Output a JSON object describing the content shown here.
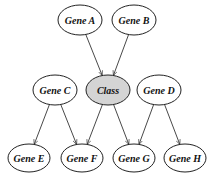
{
  "diagram": {
    "type": "bayesian-network",
    "colors": {
      "node_fill": "#ffffff",
      "class_fill": "#d4d4d4",
      "stroke": "#222222",
      "edge": "#333333"
    },
    "nodes": [
      {
        "id": "gene_a",
        "label": "Gene A",
        "cx": 80,
        "cy": 20,
        "rx": 22,
        "ry": 15,
        "highlight": false
      },
      {
        "id": "gene_b",
        "label": "Gene B",
        "cx": 134,
        "cy": 20,
        "rx": 22,
        "ry": 15,
        "highlight": false
      },
      {
        "id": "gene_c",
        "label": "Gene C",
        "cx": 55,
        "cy": 90,
        "rx": 22,
        "ry": 15,
        "highlight": false
      },
      {
        "id": "class",
        "label": "Class",
        "cx": 108,
        "cy": 90,
        "rx": 22,
        "ry": 15,
        "highlight": true
      },
      {
        "id": "gene_d",
        "label": "Gene D",
        "cx": 159,
        "cy": 90,
        "rx": 22,
        "ry": 15,
        "highlight": false
      },
      {
        "id": "gene_e",
        "label": "Gene E",
        "cx": 29,
        "cy": 158,
        "rx": 21,
        "ry": 14,
        "highlight": false
      },
      {
        "id": "gene_f",
        "label": "Gene F",
        "cx": 82,
        "cy": 158,
        "rx": 21,
        "ry": 14,
        "highlight": false
      },
      {
        "id": "gene_g",
        "label": "Gene G",
        "cx": 134,
        "cy": 158,
        "rx": 21,
        "ry": 14,
        "highlight": false
      },
      {
        "id": "gene_h",
        "label": "Gene H",
        "cx": 185,
        "cy": 158,
        "rx": 21,
        "ry": 14,
        "highlight": false
      }
    ],
    "edges": [
      {
        "from": "gene_a",
        "to": "class"
      },
      {
        "from": "gene_b",
        "to": "class"
      },
      {
        "from": "gene_c",
        "to": "gene_e"
      },
      {
        "from": "gene_c",
        "to": "gene_f"
      },
      {
        "from": "class",
        "to": "gene_f"
      },
      {
        "from": "class",
        "to": "gene_g"
      },
      {
        "from": "gene_d",
        "to": "gene_g"
      },
      {
        "from": "gene_d",
        "to": "gene_h"
      }
    ]
  }
}
